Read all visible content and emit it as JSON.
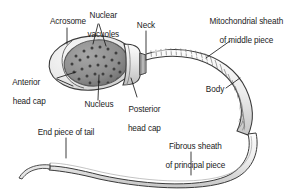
{
  "figure": {
    "background_color": "#ffffff",
    "outline_color": "#3a3a3a",
    "label_color": "#1b1b1b",
    "head_fill": "#e8e8e8",
    "nucleus_fill": "#8f8f8f",
    "vacuole_fill": "#4a4a4a",
    "midpiece_fill": "#dcdcdc",
    "tail_fill": "#efefef"
  },
  "labels": {
    "acrosome": "Acrosome",
    "nuclear_vacuoles_line1": "Nuclear",
    "nuclear_vacuoles_line2": "vacuoles",
    "neck": "Neck",
    "mitochondrial_sheath_line1": "Mitochondrial sheath",
    "mitochondrial_sheath_line2": "of middle piece",
    "anterior_head_cap_line1": "Anterior",
    "anterior_head_cap_line2": "head cap",
    "nucleus": "Nucleus",
    "posterior_head_cap_line1": "Posterior",
    "posterior_head_cap_line2": "head cap",
    "body": "Body",
    "end_piece_of_tail": "End piece of tail",
    "fibrous_sheath_line1": "Fibrous sheath",
    "fibrous_sheath_line2": "of principal piece"
  },
  "parts": [
    {
      "id": "acrosome",
      "name": "Acrosome"
    },
    {
      "id": "nuclear-vacuoles",
      "name": "Nuclear vacuoles"
    },
    {
      "id": "neck",
      "name": "Neck"
    },
    {
      "id": "mitochondrial-sheath",
      "name": "Mitochondrial sheath of middle piece"
    },
    {
      "id": "anterior-head-cap",
      "name": "Anterior head cap"
    },
    {
      "id": "nucleus",
      "name": "Nucleus"
    },
    {
      "id": "posterior-head-cap",
      "name": "Posterior head cap"
    },
    {
      "id": "body",
      "name": "Body"
    },
    {
      "id": "end-piece-of-tail",
      "name": "End piece of tail"
    },
    {
      "id": "fibrous-sheath",
      "name": "Fibrous sheath of principal piece"
    }
  ]
}
